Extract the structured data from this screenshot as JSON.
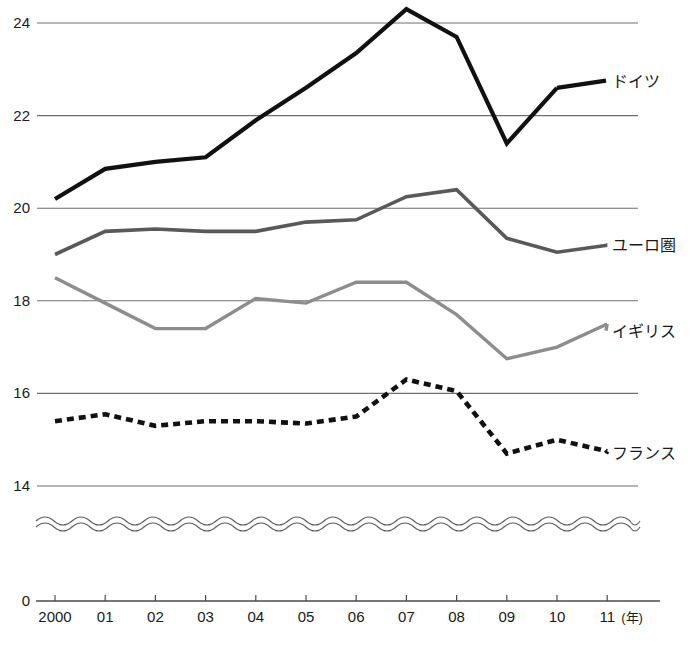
{
  "chart_data": {
    "type": "line",
    "title": "",
    "subtitle": "",
    "xlabel": "",
    "ylabel": "",
    "x_unit_label": "(年)",
    "x": [
      "2000",
      "01",
      "02",
      "03",
      "04",
      "05",
      "06",
      "07",
      "08",
      "09",
      "10",
      "11"
    ],
    "xticklabels": [
      "2000",
      "01",
      "02",
      "03",
      "04",
      "05",
      "06",
      "07",
      "08",
      "09",
      "10",
      "11"
    ],
    "yticklabels": [
      "24",
      "22",
      "20",
      "18",
      "16",
      "14",
      "0"
    ],
    "yticks": [
      24,
      22,
      20,
      18,
      16,
      14,
      0
    ],
    "ylim": [
      13.2,
      24.6
    ],
    "axis_break": true,
    "axis_break_style": "double-wave",
    "grid": "horizontal",
    "legend_position": "right-inline",
    "series": [
      {
        "name": "ドイツ",
        "style": "solid-bold",
        "color": "#111111",
        "values": [
          20.2,
          20.85,
          21.0,
          21.1,
          21.9,
          22.6,
          23.35,
          24.3,
          23.7,
          21.4,
          22.6,
          null
        ],
        "label_y_value": 22.8
      },
      {
        "name": "ユーロ圏",
        "style": "solid-medium",
        "color": "#595959",
        "values": [
          19.0,
          19.5,
          19.55,
          19.5,
          19.5,
          19.7,
          19.75,
          20.25,
          20.4,
          19.35,
          19.05,
          19.2
        ],
        "label_y_value": 19.25
      },
      {
        "name": "イギリス",
        "style": "solid-light",
        "color": "#8d8d8d",
        "values": [
          18.5,
          17.95,
          17.4,
          17.4,
          18.05,
          17.95,
          18.4,
          18.4,
          17.7,
          16.75,
          17.0,
          17.5
        ],
        "label_y_value": 17.4
      },
      {
        "name": "フランス",
        "style": "dashed-bold",
        "color": "#111111",
        "values": [
          15.4,
          15.55,
          15.3,
          15.4,
          15.4,
          15.35,
          15.5,
          16.3,
          16.05,
          14.7,
          15.0,
          14.75
        ],
        "label_y_value": 14.75
      }
    ]
  }
}
